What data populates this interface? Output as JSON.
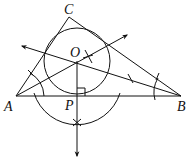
{
  "diagram": {
    "type": "geometry-construction",
    "points": {
      "A": {
        "label": "A",
        "x": 16,
        "y": 96
      },
      "B": {
        "label": "B",
        "x": 181,
        "y": 96
      },
      "C": {
        "label": "C",
        "x": 69,
        "y": 17
      },
      "O": {
        "label": "O",
        "x": 77,
        "y": 61
      },
      "P": {
        "label": "P",
        "x": 77,
        "y": 96
      }
    },
    "incircle": {
      "center": "O",
      "radius": 35
    },
    "right_angle_at": "P",
    "colors": {
      "stroke": "#111111",
      "background": "#ffffff"
    }
  }
}
